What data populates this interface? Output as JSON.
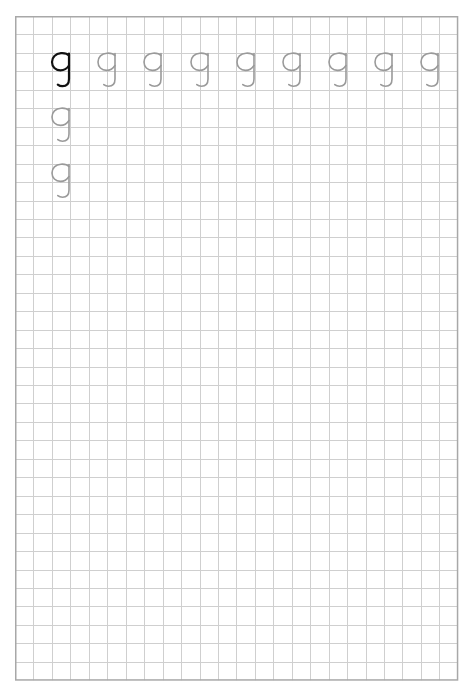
{
  "worksheet": {
    "title": "Handwriting practice grid",
    "grid": {
      "columns": 24,
      "rows": 36,
      "cell_size_px": 18.45,
      "line_color": "#cfcfcf",
      "border_color": "#a8a8a8"
    },
    "letter": "g",
    "model_color": "#111111",
    "trace_color": "#9a9a9a",
    "glyphs": [
      {
        "row": 2,
        "col": 2.5,
        "style": "model"
      },
      {
        "row": 2,
        "col": 5.0,
        "style": "trace"
      },
      {
        "row": 2,
        "col": 7.5,
        "style": "trace"
      },
      {
        "row": 2,
        "col": 10.0,
        "style": "trace"
      },
      {
        "row": 2,
        "col": 12.5,
        "style": "trace"
      },
      {
        "row": 2,
        "col": 15.0,
        "style": "trace"
      },
      {
        "row": 2,
        "col": 17.5,
        "style": "trace"
      },
      {
        "row": 2,
        "col": 20.0,
        "style": "trace"
      },
      {
        "row": 2,
        "col": 22.5,
        "style": "trace"
      },
      {
        "row": 5,
        "col": 2.5,
        "style": "trace"
      },
      {
        "row": 8,
        "col": 2.5,
        "style": "trace"
      }
    ]
  }
}
